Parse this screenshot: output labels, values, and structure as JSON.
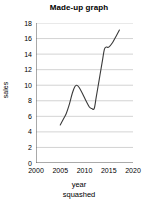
{
  "chart_data": {
    "type": "line",
    "title": "Made-up graph",
    "xlabel": "year",
    "xlabel_line2": "squashed",
    "ylabel": "sales",
    "xlim": [
      2000,
      2020
    ],
    "ylim": [
      0,
      18
    ],
    "xticks": [
      2000,
      2005,
      2010,
      2015,
      2020
    ],
    "yticks": [
      0,
      2,
      4,
      6,
      8,
      10,
      12,
      14,
      16,
      18
    ],
    "xtick_labels": [
      "2000",
      "2005",
      "2010",
      "2015",
      "2020"
    ],
    "ytick_labels": [
      "0",
      "2",
      "4",
      "6",
      "8",
      "10",
      "12",
      "14",
      "16",
      "18"
    ],
    "grid": "horizontal",
    "grid_color": "#c8c8c8",
    "legend": "none",
    "line_color": "#3a3a3a",
    "line_width": 1.1,
    "series": [
      {
        "name": "sales",
        "x": [
          2005.0,
          2005.6,
          2006.2,
          2006.9,
          2007.5,
          2008.0,
          2008.4,
          2008.9,
          2009.6,
          2010.3,
          2011.0,
          2011.5,
          2012.0,
          2012.4,
          2013.0,
          2013.6,
          2014.1,
          2014.5,
          2015.0,
          2015.8,
          2016.6,
          2017.2
        ],
        "y": [
          4.9,
          5.6,
          6.3,
          7.6,
          9.0,
          9.8,
          10.0,
          9.7,
          8.9,
          8.0,
          7.2,
          7.0,
          7.0,
          8.4,
          10.6,
          12.8,
          14.6,
          14.9,
          14.9,
          15.5,
          16.4,
          17.1
        ]
      }
    ]
  }
}
